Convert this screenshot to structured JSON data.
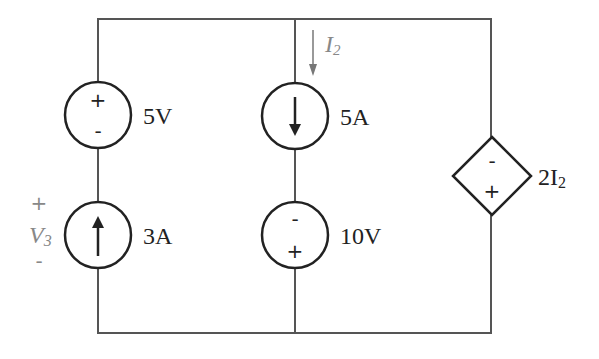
{
  "diagram": {
    "type": "circuit",
    "components": [
      {
        "id": "v1",
        "kind": "voltage-source",
        "label": "5V",
        "polarity_top": "+",
        "polarity_bottom": "-"
      },
      {
        "id": "i1",
        "kind": "current-source",
        "label": "3A",
        "direction": "up"
      },
      {
        "id": "i2",
        "kind": "current-source",
        "label": "5A",
        "direction": "down"
      },
      {
        "id": "v2",
        "kind": "voltage-source",
        "label": "10V",
        "polarity_top": "-",
        "polarity_bottom": "+"
      },
      {
        "id": "dep",
        "kind": "dependent-voltage-source",
        "label_prefix": "2I",
        "label_sub": "2",
        "polarity_top": "-",
        "polarity_bottom": "+"
      }
    ],
    "annotations": {
      "current": {
        "name": "I",
        "sub": "2",
        "direction": "down"
      },
      "voltage": {
        "name": "V",
        "sub": "3",
        "plus": "+",
        "minus": "-"
      }
    }
  }
}
